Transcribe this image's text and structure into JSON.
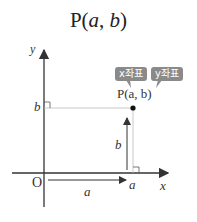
{
  "title": {
    "prefix": "P(",
    "a": "a",
    "sep": ", ",
    "b": "b",
    "suffix": ")"
  },
  "badges": {
    "x": "x좌표",
    "y": "y좌표"
  },
  "point_label": "P(a, b)",
  "axes": {
    "x_label": "x",
    "y_label": "y",
    "origin": "O"
  },
  "ticks": {
    "x": "a",
    "y": "b"
  },
  "arrows": {
    "horizontal_label": "a",
    "vertical_label": "b"
  },
  "colors": {
    "axis": "#333333",
    "guide": "#bbbbbb",
    "badge": "#8a8a8a"
  }
}
